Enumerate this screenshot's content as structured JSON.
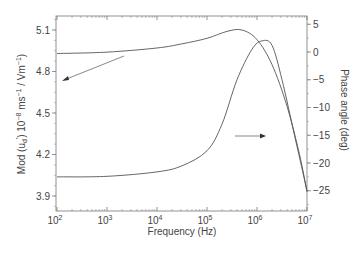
{
  "chart_data": {
    "type": "line",
    "title": "",
    "xlabel": "Frequency (Hz)",
    "ylabel": "Mod (u_d) 10^-8 ms^-1 / Vm^-1",
    "y2label": "Phase angle (deg)",
    "xscale": "log",
    "xlim": [
      100,
      10000000
    ],
    "ylim": [
      3.82,
      5.2
    ],
    "y2lim": [
      -27.5,
      7
    ],
    "x_ticks": [
      "10^2",
      "10^3",
      "10^4",
      "10^5",
      "10^6",
      "10^7"
    ],
    "y_ticks": [
      3.9,
      4.2,
      4.5,
      4.8,
      5.1
    ],
    "y2_ticks": [
      5,
      0,
      -5,
      -10,
      -15,
      -20,
      -25
    ],
    "grid": false,
    "legend": "none (arrows indicate axis per curve)",
    "series": [
      {
        "name": "Mod (u_d)",
        "axis": "left",
        "log10_freq": [
          2,
          3,
          4,
          4.5,
          5,
          5.4,
          5.7,
          6,
          6.3,
          6.6,
          6.85,
          7
        ],
        "values": [
          4.93,
          4.94,
          4.97,
          5.0,
          5.04,
          5.09,
          5.1,
          5.03,
          4.85,
          4.55,
          4.2,
          3.93
        ]
      },
      {
        "name": "Phase angle",
        "axis": "right",
        "log10_freq": [
          2,
          3,
          4,
          4.5,
          5,
          5.3,
          5.6,
          5.9,
          6.1,
          6.3,
          6.5,
          6.75,
          7
        ],
        "values": [
          -22.5,
          -22.4,
          -21.6,
          -20.5,
          -17.8,
          -13,
          -5,
          0.5,
          2,
          1.2,
          -5,
          -15,
          -25
        ]
      }
    ],
    "annotations": [
      {
        "type": "arrow",
        "points_to": "left axis",
        "from_series": "Mod (u_d)"
      },
      {
        "type": "arrow",
        "points_to": "right axis",
        "from_series": "Phase angle"
      }
    ]
  },
  "labels": {
    "xlabel": "Frequency (Hz)",
    "ylabel_main": "Mod (u",
    "ylabel_sub": "d",
    "ylabel_sup": "'",
    "ylabel_rest": ") 10",
    "ylabel_exp1": "−8",
    "ylabel_mid": " ms",
    "ylabel_exp2": "−1",
    "ylabel_mid2": " / Vm",
    "ylabel_exp3": "−1",
    "ylabel_end": ")",
    "y2label": "Phase angle (deg)",
    "x_ticks": [
      {
        "base": "10",
        "exp": "2"
      },
      {
        "base": "10",
        "exp": "3"
      },
      {
        "base": "10",
        "exp": "4"
      },
      {
        "base": "10",
        "exp": "5"
      },
      {
        "base": "10",
        "exp": "6"
      },
      {
        "base": "10",
        "exp": "7"
      }
    ],
    "y_ticks": [
      "5.1",
      "4.8",
      "4.5",
      "4.2",
      "3.9"
    ],
    "y2_ticks": [
      "5",
      "0",
      "−5",
      "−10",
      "−15",
      "−20",
      "−25"
    ]
  },
  "colors": {
    "line": "#555555",
    "axis": "#666666",
    "text": "#444444"
  }
}
